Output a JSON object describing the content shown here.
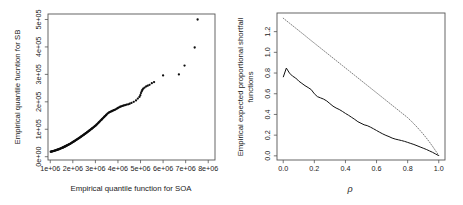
{
  "figure": {
    "background_color": "#ffffff",
    "panel_count": 2,
    "frame_color": "#555555"
  },
  "chart_data": [
    {
      "type": "scatter",
      "panel": "left",
      "title": "",
      "xlabel": "Empirical quantile function for SOA",
      "ylabel": "Empirical quantile fucntion for SB",
      "xlim": [
        900000,
        8300000
      ],
      "ylim": [
        -12000,
        520000
      ],
      "xtick_labels": [
        "1e+06",
        "2e+06",
        "3e+06",
        "4e+06",
        "5e+06",
        "6e+06",
        "7e+06",
        "8e+06"
      ],
      "xtick_values": [
        1000000,
        2000000,
        3000000,
        4000000,
        5000000,
        6000000,
        7000000,
        8000000
      ],
      "ytick_labels": [
        "0e+00",
        "1e+05",
        "2e+05",
        "3e+05",
        "4e+05",
        "5e+05"
      ],
      "ytick_values": [
        0,
        100000,
        200000,
        300000,
        400000,
        500000
      ],
      "grid": false,
      "legend": "none",
      "marker": "filled-circle",
      "marker_color": "#0d0d0d",
      "x": [
        1020000,
        1045000,
        1068000,
        1090000,
        1112000,
        1135000,
        1158000,
        1180000,
        1202000,
        1225000,
        1248000,
        1270000,
        1292000,
        1315000,
        1338000,
        1360000,
        1382000,
        1405000,
        1428000,
        1450000,
        1472000,
        1495000,
        1518000,
        1540000,
        1562000,
        1585000,
        1608000,
        1630000,
        1652000,
        1675000,
        1698000,
        1720000,
        1742000,
        1765000,
        1788000,
        1810000,
        1832000,
        1855000,
        1878000,
        1900000,
        1925000,
        1950000,
        1975000,
        2000000,
        2025000,
        2050000,
        2075000,
        2100000,
        2125000,
        2150000,
        2175000,
        2200000,
        2225000,
        2250000,
        2275000,
        2300000,
        2325000,
        2350000,
        2375000,
        2400000,
        2425000,
        2450000,
        2475000,
        2500000,
        2525000,
        2550000,
        2575000,
        2600000,
        2625000,
        2650000,
        2675000,
        2700000,
        2725000,
        2750000,
        2775000,
        2800000,
        2825000,
        2850000,
        2875000,
        2900000,
        2930000,
        2960000,
        2990000,
        3020000,
        3050000,
        3080000,
        3110000,
        3140000,
        3170000,
        3200000,
        3230000,
        3260000,
        3290000,
        3320000,
        3350000,
        3380000,
        3410000,
        3440000,
        3470000,
        3500000,
        3540000,
        3580000,
        3620000,
        3660000,
        3700000,
        3740000,
        3780000,
        3820000,
        3860000,
        3900000,
        3950000,
        4000000,
        4050000,
        4100000,
        4150000,
        4200000,
        4260000,
        4320000,
        4380000,
        4450000,
        4520000,
        4600000,
        4700000,
        4800000,
        4880000,
        4950000,
        4990000,
        5020000,
        5050000,
        5080000,
        5120000,
        5180000,
        5250000,
        5320000,
        5400000,
        5500000,
        5600000,
        6000000,
        6700000,
        6950000,
        7400000,
        7530000
      ],
      "y": [
        18000,
        18500,
        19000,
        19500,
        20000,
        20500,
        21000,
        21600,
        22200,
        22800,
        23400,
        24000,
        24600,
        25300,
        26000,
        26700,
        27400,
        28100,
        28800,
        29600,
        30400,
        31200,
        32000,
        32800,
        33600,
        34500,
        35400,
        36300,
        37200,
        38100,
        39000,
        40000,
        41000,
        42000,
        43000,
        44000,
        45000,
        46000,
        47000,
        48000,
        49300,
        50600,
        51900,
        53200,
        54500,
        55800,
        57100,
        58400,
        59700,
        61000,
        62400,
        63800,
        65200,
        66600,
        68000,
        69400,
        70800,
        72200,
        73600,
        75000,
        76500,
        78000,
        79500,
        81000,
        82500,
        84000,
        85500,
        87000,
        88500,
        90000,
        91600,
        93200,
        94800,
        96400,
        98000,
        99600,
        101200,
        102800,
        104400,
        106000,
        108000,
        110000,
        112000,
        114000,
        116500,
        119000,
        121500,
        124000,
        126500,
        129000,
        131500,
        134000,
        136500,
        139000,
        141500,
        144000,
        146500,
        149000,
        151500,
        154000,
        157000,
        160000,
        162000,
        163500,
        165000,
        166500,
        168000,
        169500,
        171000,
        172500,
        175000,
        177500,
        180000,
        182000,
        183500,
        185000,
        186500,
        188000,
        189500,
        191000,
        193000,
        196000,
        200000,
        205000,
        212000,
        218000,
        224000,
        232000,
        238000,
        243000,
        248000,
        252000,
        256000,
        259000,
        262000,
        268000,
        272000,
        296000,
        300000,
        332000,
        398000,
        500000
      ]
    },
    {
      "type": "line",
      "panel": "right",
      "title": "",
      "xlabel": "ρ",
      "ylabel": "Empirical expected proportional shortfall functions",
      "ylabel_lines": [
        "Empirical expected proportional shortfall",
        "functions"
      ],
      "xlim": [
        -0.04,
        1.04
      ],
      "ylim": [
        -0.04,
        1.38
      ],
      "xtick_labels": [
        "0.0",
        "0.2",
        "0.4",
        "0.6",
        "0.8",
        "1.0"
      ],
      "xtick_values": [
        0.0,
        0.2,
        0.4,
        0.6,
        0.8,
        1.0
      ],
      "ytick_labels": [
        "0.0",
        "0.2",
        "0.4",
        "0.6",
        "0.8",
        "1.0",
        "1.2"
      ],
      "ytick_values": [
        0.0,
        0.2,
        0.4,
        0.6,
        0.8,
        1.0,
        1.2
      ],
      "grid": false,
      "legend": "none",
      "x": [
        0.0,
        0.02,
        0.04,
        0.06,
        0.08,
        0.1,
        0.12,
        0.14,
        0.16,
        0.18,
        0.2,
        0.22,
        0.24,
        0.26,
        0.28,
        0.3,
        0.32,
        0.34,
        0.36,
        0.38,
        0.4,
        0.42,
        0.44,
        0.46,
        0.48,
        0.5,
        0.52,
        0.54,
        0.56,
        0.58,
        0.6,
        0.62,
        0.64,
        0.66,
        0.68,
        0.7,
        0.72,
        0.74,
        0.76,
        0.78,
        0.8,
        0.82,
        0.84,
        0.86,
        0.88,
        0.9,
        0.92,
        0.94,
        0.96,
        0.98,
        1.0
      ],
      "series": [
        {
          "name": "dotted-upper",
          "style": "dotted",
          "color": "#6e6e6e",
          "values": [
            1.33,
            1.306,
            1.282,
            1.258,
            1.234,
            1.21,
            1.186,
            1.162,
            1.137,
            1.113,
            1.089,
            1.065,
            1.041,
            1.017,
            0.993,
            0.969,
            0.945,
            0.921,
            0.897,
            0.873,
            0.849,
            0.825,
            0.801,
            0.777,
            0.753,
            0.729,
            0.705,
            0.681,
            0.657,
            0.633,
            0.609,
            0.585,
            0.561,
            0.537,
            0.513,
            0.489,
            0.465,
            0.441,
            0.417,
            0.393,
            0.369,
            0.34,
            0.31,
            0.278,
            0.245,
            0.21,
            0.173,
            0.134,
            0.092,
            0.048,
            0.005
          ]
        },
        {
          "name": "solid-lower",
          "style": "solid",
          "color": "#111111",
          "values": [
            0.76,
            0.848,
            0.8,
            0.77,
            0.752,
            0.722,
            0.7,
            0.678,
            0.66,
            0.64,
            0.6,
            0.572,
            0.56,
            0.548,
            0.53,
            0.505,
            0.48,
            0.462,
            0.448,
            0.43,
            0.41,
            0.392,
            0.372,
            0.352,
            0.33,
            0.315,
            0.3,
            0.292,
            0.278,
            0.262,
            0.245,
            0.228,
            0.212,
            0.198,
            0.186,
            0.172,
            0.162,
            0.155,
            0.148,
            0.14,
            0.13,
            0.12,
            0.11,
            0.098,
            0.086,
            0.074,
            0.062,
            0.048,
            0.034,
            0.018,
            0.002
          ]
        }
      ]
    }
  ]
}
